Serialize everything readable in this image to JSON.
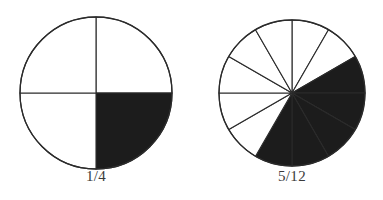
{
  "figure": {
    "background_color": "#ffffff",
    "stroke_color": "#2b2b2b",
    "fill_color": "#1c1c1c",
    "empty_color": "#ffffff",
    "caption_color": "#3a3a3a"
  },
  "diagrams": [
    {
      "id": "pie-left",
      "name": "quarter-circle-diagram",
      "caption": "1/4",
      "center_x": 96,
      "center_y": 93,
      "radius": 76,
      "total_sectors": 4,
      "shaded_sectors": 1,
      "sector_angle_deg": 90,
      "start_angle_deg": 0,
      "shaded_indices": [
        1
      ],
      "shaded_description": "lower-right quadrant"
    },
    {
      "id": "pie-right",
      "name": "twelfths-circle-diagram",
      "caption": "5/12",
      "center_x": 292,
      "center_y": 93,
      "radius": 73,
      "total_sectors": 12,
      "shaded_sectors": 5,
      "sector_angle_deg": 30,
      "start_angle_deg": 0,
      "shaded_indices": [
        2,
        3,
        4,
        5,
        6
      ],
      "shaded_description": "five consecutive twelfths from 2 o'clock clockwise to 7 o'clock"
    }
  ],
  "chart_data": {
    "type": "pie",
    "title": "",
    "charts": [
      {
        "label": "1/4",
        "categories": [
          "shaded",
          "unshaded"
        ],
        "values": [
          1,
          3
        ],
        "fraction_numerator": 1,
        "fraction_denominator": 4,
        "fraction_value": 0.25,
        "slice_count": 4,
        "slice_degrees": 90
      },
      {
        "label": "5/12",
        "categories": [
          "shaded",
          "unshaded"
        ],
        "values": [
          5,
          7
        ],
        "fraction_numerator": 5,
        "fraction_denominator": 12,
        "fraction_value": 0.4167,
        "slice_count": 12,
        "slice_degrees": 30
      }
    ],
    "legend": "none",
    "grid": false
  }
}
